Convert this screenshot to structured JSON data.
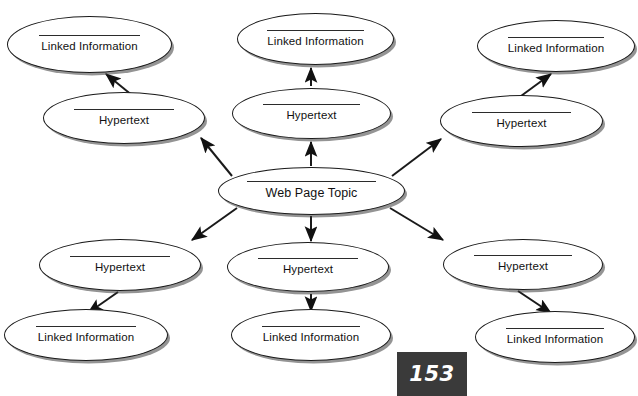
{
  "diagram": {
    "type": "radial-concept-map",
    "center": {
      "id": "center",
      "label": "Web Page Topic",
      "x": 218,
      "y": 167,
      "w": 187,
      "h": 48
    },
    "nodes": [
      {
        "id": "ht-left",
        "label": "Hypertext",
        "x": 43,
        "y": 92,
        "w": 162,
        "h": 52
      },
      {
        "id": "li-left",
        "label": "Linked Information",
        "x": 7,
        "y": 16,
        "w": 165,
        "h": 57
      },
      {
        "id": "ht-topcenter",
        "label": "Hypertext",
        "x": 232,
        "y": 88,
        "w": 159,
        "h": 51
      },
      {
        "id": "li-topcenter",
        "label": "Linked Information",
        "x": 237,
        "y": 13,
        "w": 157,
        "h": 52
      },
      {
        "id": "ht-right",
        "label": "Hypertext",
        "x": 440,
        "y": 95,
        "w": 163,
        "h": 52
      },
      {
        "id": "li-right",
        "label": "Linked Information",
        "x": 477,
        "y": 20,
        "w": 158,
        "h": 52
      },
      {
        "id": "ht-botleft",
        "label": "Hypertext",
        "x": 39,
        "y": 239,
        "w": 162,
        "h": 52
      },
      {
        "id": "li-botleft",
        "label": "Linked Information",
        "x": 4,
        "y": 309,
        "w": 164,
        "h": 52
      },
      {
        "id": "ht-botcenter",
        "label": "Hypertext",
        "x": 227,
        "y": 242,
        "w": 162,
        "h": 50
      },
      {
        "id": "li-botcenter",
        "label": "Linked Information",
        "x": 231,
        "y": 309,
        "w": 160,
        "h": 52
      },
      {
        "id": "ht-botright",
        "label": "Hypertext",
        "x": 443,
        "y": 239,
        "w": 160,
        "h": 51
      },
      {
        "id": "li-botright",
        "label": "Linked Information",
        "x": 475,
        "y": 311,
        "w": 160,
        "h": 52
      }
    ],
    "edges": [
      {
        "from": "center",
        "to": "ht-left",
        "x1": 232,
        "y1": 176,
        "x2": 201,
        "y2": 138
      },
      {
        "from": "ht-left",
        "to": "li-left",
        "x1": 133,
        "y1": 96,
        "x2": 106,
        "y2": 74
      },
      {
        "from": "center",
        "to": "ht-topcenter",
        "x1": 311,
        "y1": 166,
        "x2": 311,
        "y2": 142
      },
      {
        "from": "ht-topcenter",
        "to": "li-topcenter",
        "x1": 311,
        "y1": 86,
        "x2": 311,
        "y2": 68
      },
      {
        "from": "center",
        "to": "ht-right",
        "x1": 392,
        "y1": 176,
        "x2": 441,
        "y2": 139
      },
      {
        "from": "ht-right",
        "to": "li-right",
        "x1": 521,
        "y1": 96,
        "x2": 551,
        "y2": 74
      },
      {
        "from": "center",
        "to": "ht-botleft",
        "x1": 237,
        "y1": 208,
        "x2": 192,
        "y2": 240
      },
      {
        "from": "ht-botleft",
        "to": "li-botleft",
        "x1": 118,
        "y1": 292,
        "x2": 88,
        "y2": 313
      },
      {
        "from": "center",
        "to": "ht-botcenter",
        "x1": 311,
        "y1": 216,
        "x2": 311,
        "y2": 241
      },
      {
        "from": "ht-botcenter",
        "to": "li-botcenter",
        "x1": 311,
        "y1": 294,
        "x2": 311,
        "y2": 311
      },
      {
        "from": "center",
        "to": "ht-botright",
        "x1": 390,
        "y1": 208,
        "x2": 443,
        "y2": 240
      },
      {
        "from": "ht-botright",
        "to": "li-botright",
        "x1": 518,
        "y1": 291,
        "x2": 551,
        "y2": 313
      }
    ]
  },
  "page_badge": {
    "number": "153",
    "x": 397,
    "y": 352,
    "w": 70,
    "h": 44
  },
  "colors": {
    "stroke": "#1a1a1a",
    "text": "#111111",
    "badge_background": "#3a3a3a",
    "badge_text": "#ffffff",
    "page_background": "#ffffff"
  }
}
